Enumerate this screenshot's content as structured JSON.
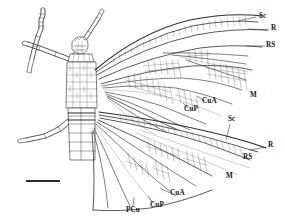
{
  "figure": {
    "kind": "scientific-line-drawing",
    "background_color": "#ffffff",
    "ink_color": "#2a2a2a"
  },
  "labels": [
    {
      "id": "sc-fore",
      "text": "Sc",
      "x": 259,
      "y": 16,
      "wing": "forewing"
    },
    {
      "id": "r-fore",
      "text": "R",
      "x": 271,
      "y": 28,
      "wing": "forewing"
    },
    {
      "id": "rs-fore",
      "text": "RS",
      "x": 268,
      "y": 45,
      "wing": "forewing"
    },
    {
      "id": "m-fore",
      "text": "M",
      "x": 252,
      "y": 95,
      "wing": "forewing"
    },
    {
      "id": "cua-fore",
      "text": "CuA",
      "x": 204,
      "y": 102,
      "wing": "forewing"
    },
    {
      "id": "cup-fore",
      "text": "CuP",
      "x": 186,
      "y": 110,
      "wing": "forewing"
    },
    {
      "id": "sc-hind",
      "text": "Sc",
      "x": 229,
      "y": 120,
      "wing": "hindwing"
    },
    {
      "id": "r-hind",
      "text": "R",
      "x": 268,
      "y": 145,
      "wing": "hindwing"
    },
    {
      "id": "rs-hind",
      "text": "RS",
      "x": 245,
      "y": 157,
      "wing": "hindwing"
    },
    {
      "id": "m-hind",
      "text": "M",
      "x": 227,
      "y": 177,
      "wing": "hindwing"
    },
    {
      "id": "cua-hind",
      "text": "CuA",
      "x": 172,
      "y": 194,
      "wing": "hindwing"
    },
    {
      "id": "cup-hind",
      "text": "CuP",
      "x": 152,
      "y": 205,
      "wing": "hindwing"
    },
    {
      "id": "pcu-hind",
      "text": "PCu",
      "x": 129,
      "y": 210,
      "wing": "hindwing"
    }
  ],
  "scale_bar": {
    "x": 26,
    "y": 180,
    "width": 34,
    "caption": ""
  }
}
